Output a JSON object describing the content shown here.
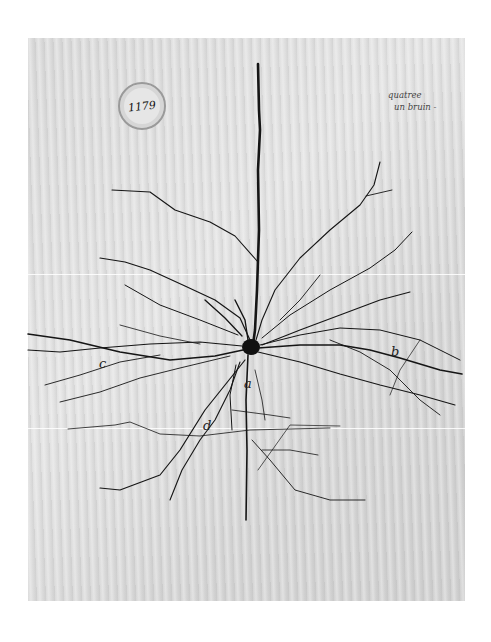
{
  "image": {
    "subject": "Hand-drawn pyramidal neuron illustration on aged paper",
    "background_color": "#ffffff",
    "paper_color": "#dadada",
    "ink_color": "#151515"
  },
  "stamp": {
    "number": "1179"
  },
  "handwritten_note": {
    "line1": "quatree",
    "line2": "un bruin -"
  },
  "labels": {
    "a": "a",
    "b": "b",
    "c": "c",
    "d": "d"
  }
}
